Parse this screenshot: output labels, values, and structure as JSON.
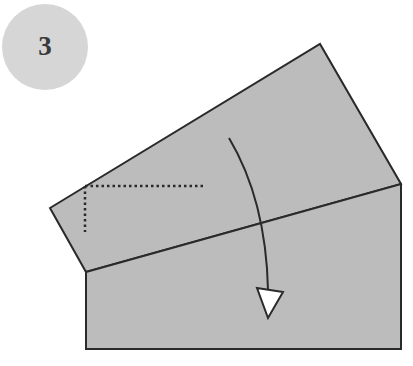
{
  "step": {
    "number": "3",
    "badge_color": "#d6d6d6"
  },
  "diagram": {
    "paper_color": "#bcbcbc",
    "line_color": "#2a2a2a",
    "arrow_fill": "#ffffff",
    "shapes": {
      "back_flap": [
        [
          50,
          208
        ],
        [
          320,
          44
        ],
        [
          401,
          184
        ],
        [
          86,
          272
        ]
      ],
      "front_rectangle": [
        [
          86,
          272
        ],
        [
          401,
          184
        ],
        [
          401,
          349
        ],
        [
          86,
          349
        ]
      ]
    },
    "dotted_guide": {
      "horizontal": [
        [
          85,
          186
        ],
        [
          204,
          186
        ]
      ],
      "vertical": [
        [
          85,
          186
        ],
        [
          85,
          232
        ]
      ]
    },
    "fold_arrow": {
      "type": "valley-fold",
      "path": "M229 138 Q 266 200 268 290",
      "head": [
        [
          257,
          288
        ],
        [
          283,
          292
        ],
        [
          268,
          318
        ]
      ]
    }
  }
}
